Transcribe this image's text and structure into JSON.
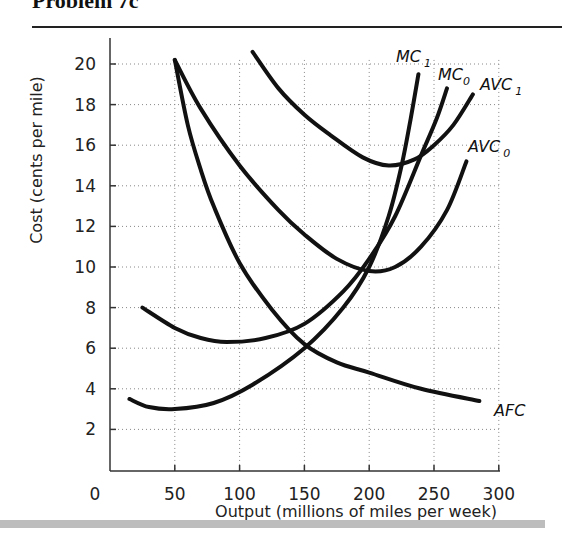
{
  "title": "Problem 7c",
  "chart_data": {
    "type": "line",
    "title": "Problem 7c",
    "xlabel": "Output (millions of miles per week)",
    "ylabel": "Cost (cents per mile)",
    "xlim": [
      0,
      300
    ],
    "ylim": [
      0,
      21
    ],
    "x_ticks": [
      "0",
      "50",
      "100",
      "150",
      "200",
      "250",
      "300"
    ],
    "y_ticks": [
      "2",
      "4",
      "6",
      "8",
      "10",
      "12",
      "14",
      "16",
      "18",
      "20"
    ],
    "grid": true,
    "series": [
      {
        "name": "MC1",
        "label": "MC",
        "sub": "1",
        "points": [
          [
            15,
            3.5
          ],
          [
            30,
            3.1
          ],
          [
            50,
            3.0
          ],
          [
            80,
            3.3
          ],
          [
            110,
            4.2
          ],
          [
            150,
            6.0
          ],
          [
            180,
            8.0
          ],
          [
            200,
            10.0
          ],
          [
            215,
            12.5
          ],
          [
            225,
            15.0
          ],
          [
            232,
            17.3
          ],
          [
            238,
            19.5
          ]
        ]
      },
      {
        "name": "MC0",
        "label": "MC",
        "sub": "0",
        "points": [
          [
            25,
            8.0
          ],
          [
            50,
            7.0
          ],
          [
            70,
            6.5
          ],
          [
            90,
            6.3
          ],
          [
            120,
            6.5
          ],
          [
            150,
            7.2
          ],
          [
            180,
            8.8
          ],
          [
            200,
            10.4
          ],
          [
            220,
            12.5
          ],
          [
            240,
            15.5
          ],
          [
            252,
            17.3
          ],
          [
            260,
            18.8
          ]
        ]
      },
      {
        "name": "AVC1",
        "label": "AVC",
        "sub": "1",
        "points": [
          [
            110,
            20.6
          ],
          [
            130,
            18.8
          ],
          [
            150,
            17.5
          ],
          [
            170,
            16.5
          ],
          [
            195,
            15.4
          ],
          [
            215,
            15.0
          ],
          [
            235,
            15.3
          ],
          [
            250,
            16.0
          ],
          [
            265,
            17.0
          ],
          [
            280,
            18.5
          ]
        ]
      },
      {
        "name": "AVC0",
        "label": "AVC",
        "sub": "0",
        "points": [
          [
            50,
            20.2
          ],
          [
            70,
            17.8
          ],
          [
            100,
            15.0
          ],
          [
            130,
            12.8
          ],
          [
            150,
            11.6
          ],
          [
            175,
            10.4
          ],
          [
            200,
            9.8
          ],
          [
            220,
            10.0
          ],
          [
            240,
            11.0
          ],
          [
            260,
            12.8
          ],
          [
            275,
            15.2
          ]
        ]
      },
      {
        "name": "AFC",
        "label": "AFC",
        "sub": "",
        "points": [
          [
            50,
            20.2
          ],
          [
            60,
            17.0
          ],
          [
            70,
            14.8
          ],
          [
            80,
            13.0
          ],
          [
            100,
            10.2
          ],
          [
            125,
            7.9
          ],
          [
            150,
            6.2
          ],
          [
            175,
            5.3
          ],
          [
            200,
            4.8
          ],
          [
            240,
            4.0
          ],
          [
            285,
            3.4
          ]
        ]
      }
    ]
  },
  "axes": {
    "ylabel": "Cost (cents per mile)",
    "xlabel": "Output (millions of miles per week)",
    "zero": "0",
    "x_ticks": [
      "50",
      "100",
      "150",
      "200",
      "250",
      "300"
    ],
    "y_ticks": [
      "2",
      "4",
      "6",
      "8",
      "10",
      "12",
      "14",
      "16",
      "18",
      "20"
    ]
  },
  "labels": {
    "mc1": "MC",
    "mc1_sub": "1",
    "mc0": "MC",
    "mc0_sub": "0",
    "avc1": "AVC",
    "avc1_sub": "1",
    "avc0": "AVC",
    "avc0_sub": "0",
    "afc": "AFC"
  }
}
